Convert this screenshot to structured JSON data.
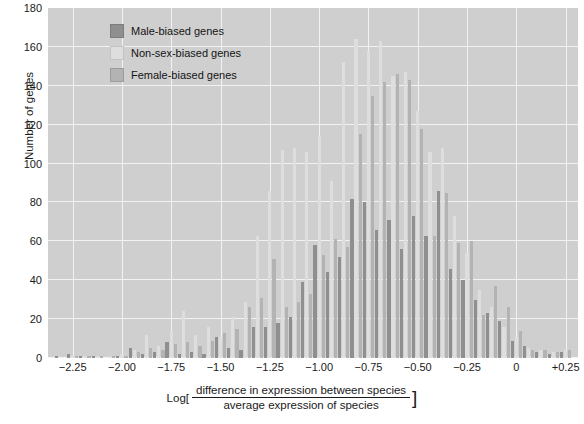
{
  "chart_data": {
    "type": "bar",
    "title": "",
    "subtitle": "",
    "ylabel": "Number of genes",
    "xlabel": "Log[ difference in expression between species / average expression of species ]",
    "xlabel_parts": {
      "prefix": "Log[",
      "numerator": "difference in expression between species",
      "denominator": "average expression of species",
      "suffix": "]"
    },
    "ylim": [
      0,
      180
    ],
    "y_ticks": [
      0,
      20,
      40,
      60,
      80,
      100,
      120,
      140,
      160,
      180
    ],
    "xlim": [
      -2.375,
      0.3125
    ],
    "x_ticks": [
      -2.25,
      -2.0,
      -1.75,
      -1.5,
      -1.25,
      -1.0,
      -0.75,
      -0.5,
      -0.25,
      0,
      0.25
    ],
    "x_tick_labels": [
      "−2.25",
      "−2.00",
      "−1.75",
      "−1.50",
      "−1.25",
      "−1.00",
      "−0.75",
      "−0.50",
      "−0.25",
      "0",
      "+0.25"
    ],
    "grid": true,
    "legend_position": "top-left",
    "bin_width": 0.0625,
    "bin_centers": [
      -2.3125,
      -2.25,
      -2.1875,
      -2.125,
      -2.0625,
      -2.0,
      -1.9375,
      -1.875,
      -1.8125,
      -1.75,
      -1.6875,
      -1.625,
      -1.5625,
      -1.5,
      -1.4375,
      -1.375,
      -1.3125,
      -1.25,
      -1.1875,
      -1.125,
      -1.0625,
      -1.0,
      -0.9375,
      -0.875,
      -0.8125,
      -0.75,
      -0.6875,
      -0.625,
      -0.5625,
      -0.5,
      -0.4375,
      -0.375,
      -0.3125,
      -0.25,
      -0.1875,
      -0.125,
      -0.0625,
      0.0,
      0.0625,
      0.125,
      0.1875,
      0.25
    ],
    "series": [
      {
        "name": "Male-biased genes",
        "color": "#8f8f8f",
        "values": [
          1,
          2,
          1,
          1,
          0,
          1,
          5,
          2,
          3,
          8,
          2,
          3,
          2,
          11,
          5,
          4,
          16,
          16,
          18,
          21,
          39,
          58,
          44,
          52,
          82,
          80,
          66,
          71,
          56,
          73,
          63,
          86,
          46,
          40,
          30,
          23,
          19,
          9,
          6,
          3,
          2,
          3
        ]
      },
      {
        "name": "Non-sex-biased genes",
        "color": "#dedede",
        "values": [
          0,
          1,
          1,
          1,
          1,
          2,
          4,
          12,
          6,
          14,
          24,
          12,
          16,
          11,
          21,
          29,
          63,
          86,
          107,
          108,
          106,
          114,
          91,
          152,
          164,
          158,
          163,
          145,
          147,
          127,
          106,
          108,
          73,
          54,
          35,
          26,
          16,
          11,
          5,
          4,
          3,
          4
        ]
      },
      {
        "name": "Female-biased genes",
        "color": "#b3b3b3",
        "values": [
          0,
          1,
          1,
          1,
          1,
          1,
          3,
          5,
          4,
          7,
          8,
          6,
          9,
          13,
          15,
          26,
          31,
          51,
          26,
          29,
          33,
          53,
          61,
          57,
          115,
          135,
          142,
          146,
          143,
          118,
          63,
          85,
          59,
          60,
          22,
          37,
          26,
          14,
          4,
          4,
          3,
          4
        ]
      }
    ]
  },
  "legend": {
    "items": [
      {
        "label": "Male-biased genes",
        "color": "#8f8f8f"
      },
      {
        "label": "Non-sex-biased genes",
        "color": "#dedede"
      },
      {
        "label": "Female-biased genes",
        "color": "#b3b3b3"
      }
    ]
  },
  "colors": {
    "plot_background": "#cfcfcf",
    "gridline": "#f2f2f2",
    "page_background": "#ffffff",
    "text": "#1a1a1a"
  }
}
